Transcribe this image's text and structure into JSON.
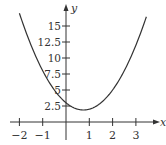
{
  "chart_data": {
    "type": "line",
    "title": "",
    "xlabel": "x",
    "ylabel": "y",
    "function": "y = 2x^2 - 3x + 3",
    "xlim": [
      -2.3,
      3.8
    ],
    "ylim": [
      0,
      18
    ],
    "x_ticks": [
      -2,
      -1,
      1,
      2,
      3
    ],
    "x_tick_labels": [
      "−2",
      "−1",
      "1",
      "2",
      "3"
    ],
    "y_ticks": [
      2.5,
      5,
      7.5,
      10,
      12.5,
      15
    ],
    "y_tick_labels": [
      "2.5",
      "5",
      "7.5",
      "10",
      "12.5",
      "15"
    ],
    "grid": false,
    "legend": null,
    "series": [
      {
        "name": "curve",
        "x": [
          -2,
          -1.5,
          -1,
          -0.5,
          0,
          0.5,
          0.75,
          1,
          1.5,
          2,
          2.5,
          3,
          3.45
        ],
        "y": [
          17,
          12,
          8,
          5,
          3,
          2,
          1.875,
          2,
          3,
          5,
          8,
          12,
          16.45
        ]
      }
    ],
    "color": "#333333"
  }
}
